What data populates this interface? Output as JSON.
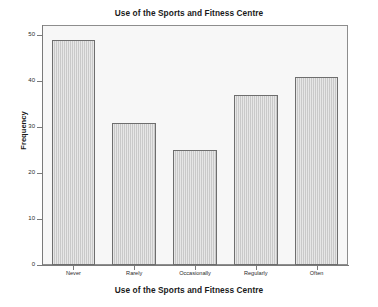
{
  "chart_data": {
    "type": "bar",
    "title": "Use of the Sports and Fitness Centre",
    "xlabel": "Use of the Sports and Fitness Centre",
    "ylabel": "Frequency",
    "categories": [
      "Never",
      "Rarely",
      "Occasionally",
      "Regularly",
      "Often"
    ],
    "values": [
      49,
      31,
      25,
      37,
      41
    ],
    "ylim": [
      0,
      52
    ],
    "yticks": [
      0,
      10,
      20,
      30,
      40,
      50
    ],
    "ytick_labels": [
      "0",
      "10",
      "20",
      "30",
      "40",
      "50"
    ],
    "grid": false,
    "legend": false,
    "bar_fill_color": "#c9c9c9",
    "bar_border_color": "#6e6e6e",
    "plot_background_color": "#f7f7f7",
    "axis_color": "#7a7a7a",
    "text_color": "#1a1a1a"
  }
}
